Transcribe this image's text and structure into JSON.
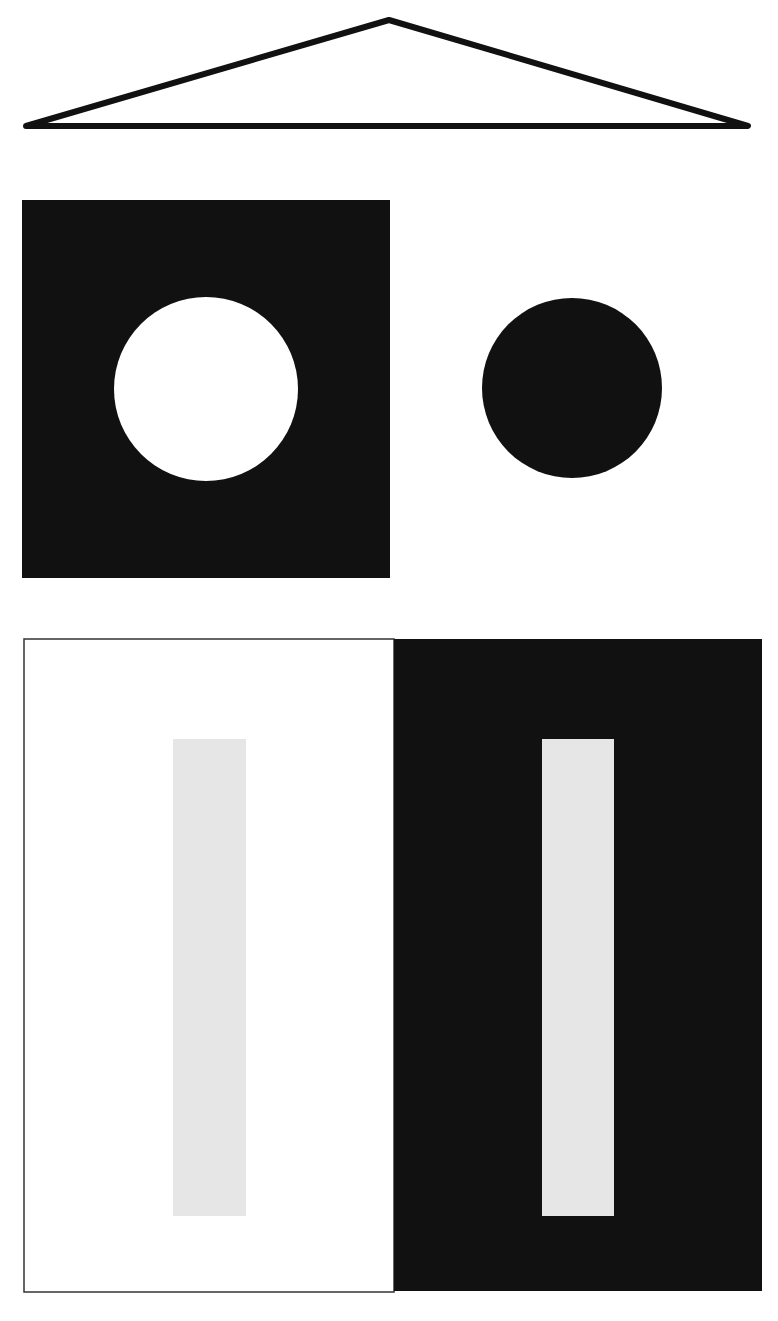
{
  "canvas": {
    "width": 778,
    "height": 1321,
    "background": "#ffffff"
  },
  "colors": {
    "black": "#111111",
    "white": "#ffffff",
    "gray_bar": "#e6e6e6",
    "border": "#333333"
  },
  "triangle": {
    "points": [
      [
        26,
        126
      ],
      [
        389,
        20
      ],
      [
        748,
        126
      ]
    ],
    "stroke": "#111111",
    "stroke_width": 6,
    "fill": "#ffffff"
  },
  "top_row": {
    "black_square": {
      "x": 22,
      "y": 200,
      "width": 368,
      "height": 378,
      "fill": "#111111"
    },
    "white_circle": {
      "cx": 206,
      "cy": 389,
      "r": 92,
      "fill": "#ffffff"
    },
    "black_circle": {
      "cx": 572,
      "cy": 388,
      "r": 90,
      "fill": "#111111"
    }
  },
  "bottom_row": {
    "white_panel": {
      "x": 24,
      "y": 639,
      "width": 370,
      "height": 653,
      "fill": "#ffffff",
      "stroke": "#333333",
      "stroke_width": 1.5
    },
    "black_panel": {
      "x": 394,
      "y": 639,
      "width": 368,
      "height": 652,
      "fill": "#111111"
    },
    "left_gray_bar": {
      "x": 173,
      "y": 739,
      "width": 73,
      "height": 477,
      "fill": "#e6e6e6"
    },
    "right_gray_bar": {
      "x": 542,
      "y": 739,
      "width": 72,
      "height": 477,
      "fill": "#e6e6e6"
    }
  }
}
